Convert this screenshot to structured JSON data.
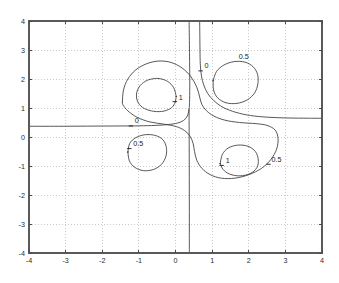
{
  "figure": {
    "title": "",
    "background_color": "#ffffff",
    "axes_color": "#5a5a5a",
    "grid_color": "#b4b4b4",
    "contour_color": "#3a3a3a"
  },
  "chart_data": {
    "type": "line",
    "subtype": "contour",
    "title": "",
    "xlabel": "",
    "ylabel": "",
    "xlim": [
      -4,
      4
    ],
    "ylim": [
      -4,
      4
    ],
    "grid": true,
    "grid_style": "dotted",
    "legend": "none",
    "x_ticks": [
      -4,
      -3,
      -2,
      -1,
      0,
      1,
      2,
      3,
      4
    ],
    "y_ticks": [
      -4,
      -3,
      -2,
      -1,
      0,
      1,
      2,
      3,
      4
    ],
    "x_tick_labels": [
      "-4",
      "-3",
      "-2",
      "-1",
      "0",
      "1",
      "2",
      "3",
      "4"
    ],
    "y_tick_labels": [
      "-4",
      "-3",
      "-2",
      "-1",
      "0",
      "1",
      "2",
      "3",
      "4"
    ],
    "contour_levels": [
      0,
      0.5,
      1
    ],
    "contour_label_values": [
      "0",
      "0.5",
      "1",
      "0",
      "0.5",
      "1",
      "0.5"
    ],
    "contours": [
      {
        "level": 0,
        "name": "zero-left-branch",
        "closed": false,
        "points": [
          [
            -4.0,
            0.37
          ],
          [
            -3.2,
            0.37
          ],
          [
            -2.4,
            0.375
          ],
          [
            -1.6,
            0.38
          ],
          [
            -1.0,
            0.385
          ],
          [
            -0.55,
            0.4
          ],
          [
            -0.2,
            0.43
          ],
          [
            0.05,
            0.48
          ],
          [
            0.22,
            0.57
          ],
          [
            0.32,
            0.72
          ],
          [
            0.37,
            0.95
          ],
          [
            0.385,
            1.3
          ],
          [
            0.39,
            1.9
          ],
          [
            0.385,
            2.6
          ],
          [
            0.38,
            3.2
          ],
          [
            0.375,
            3.7
          ],
          [
            0.372,
            4.0
          ]
        ]
      },
      {
        "level": 0,
        "name": "zero-right-branch",
        "closed": false,
        "points": [
          [
            0.66,
            4.0
          ],
          [
            0.665,
            3.4
          ],
          [
            0.67,
            2.85
          ],
          [
            0.68,
            2.45
          ],
          [
            0.71,
            2.1
          ],
          [
            0.77,
            1.8
          ],
          [
            0.88,
            1.5
          ],
          [
            1.05,
            1.25
          ],
          [
            1.3,
            1.02
          ],
          [
            1.65,
            0.85
          ],
          [
            2.05,
            0.74
          ],
          [
            2.55,
            0.68
          ],
          [
            3.1,
            0.655
          ],
          [
            3.6,
            0.648
          ],
          [
            4.0,
            0.645
          ]
        ]
      },
      {
        "level": 0,
        "name": "zero-descending-branch",
        "closed": false,
        "points": [
          [
            0.37,
            0.95
          ],
          [
            0.372,
            0.4
          ],
          [
            0.374,
            -0.3
          ],
          [
            0.376,
            -1.0
          ],
          [
            0.377,
            -1.8
          ],
          [
            0.378,
            -2.6
          ],
          [
            0.378,
            -3.3
          ],
          [
            0.378,
            -4.0
          ]
        ]
      },
      {
        "level": 0.5,
        "name": "upper-left-outer-lobe",
        "closed": false,
        "points": [
          [
            -1.45,
            1.2
          ],
          [
            -1.42,
            1.62
          ],
          [
            -1.3,
            2.0
          ],
          [
            -1.08,
            2.32
          ],
          [
            -0.78,
            2.53
          ],
          [
            -0.45,
            2.62
          ],
          [
            -0.12,
            2.57
          ],
          [
            0.18,
            2.38
          ],
          [
            0.42,
            2.08
          ],
          [
            0.58,
            1.72
          ],
          [
            0.66,
            1.38
          ],
          [
            0.72,
            1.12
          ],
          [
            0.85,
            0.9
          ],
          [
            1.05,
            0.72
          ],
          [
            1.35,
            0.58
          ],
          [
            1.75,
            0.5
          ],
          [
            2.2,
            0.46
          ],
          [
            2.5,
            0.4
          ],
          [
            2.72,
            0.24
          ],
          [
            2.8,
            -0.05
          ],
          [
            2.76,
            -0.42
          ],
          [
            2.6,
            -0.78
          ],
          [
            2.35,
            -1.08
          ],
          [
            2.0,
            -1.3
          ],
          [
            1.62,
            -1.42
          ],
          [
            1.25,
            -1.42
          ],
          [
            0.95,
            -1.3
          ],
          [
            0.72,
            -1.08
          ],
          [
            0.58,
            -0.8
          ],
          [
            0.52,
            -0.5
          ],
          [
            0.48,
            -0.22
          ],
          [
            0.4,
            0.02
          ],
          [
            0.25,
            0.22
          ],
          [
            0.02,
            0.36
          ],
          [
            -0.3,
            0.44
          ],
          [
            -0.7,
            0.52
          ],
          [
            -1.05,
            0.68
          ],
          [
            -1.3,
            0.9
          ],
          [
            -1.43,
            1.1
          ],
          [
            -1.45,
            1.2
          ]
        ]
      },
      {
        "level": 1,
        "name": "upper-left-inner-loop",
        "closed": true,
        "points": [
          [
            0.02,
            1.4
          ],
          [
            -0.05,
            1.7
          ],
          [
            -0.22,
            1.92
          ],
          [
            -0.48,
            2.02
          ],
          [
            -0.76,
            1.96
          ],
          [
            -0.96,
            1.78
          ],
          [
            -1.06,
            1.52
          ],
          [
            -1.04,
            1.24
          ],
          [
            -0.9,
            1.02
          ],
          [
            -0.66,
            0.9
          ],
          [
            -0.38,
            0.88
          ],
          [
            -0.14,
            0.98
          ],
          [
            -0.02,
            1.16
          ],
          [
            0.02,
            1.4
          ]
        ]
      },
      {
        "level": 0.5,
        "name": "upper-right-loop",
        "closed": true,
        "points": [
          [
            1.03,
            1.95
          ],
          [
            1.12,
            2.26
          ],
          [
            1.32,
            2.48
          ],
          [
            1.6,
            2.6
          ],
          [
            1.9,
            2.58
          ],
          [
            2.12,
            2.42
          ],
          [
            2.24,
            2.16
          ],
          [
            2.25,
            1.84
          ],
          [
            2.16,
            1.52
          ],
          [
            1.96,
            1.28
          ],
          [
            1.68,
            1.16
          ],
          [
            1.38,
            1.18
          ],
          [
            1.15,
            1.35
          ],
          [
            1.04,
            1.62
          ],
          [
            1.03,
            1.95
          ]
        ]
      },
      {
        "level": 0.5,
        "name": "lower-left-loop",
        "closed": true,
        "points": [
          [
            -1.3,
            -0.52
          ],
          [
            -1.25,
            -0.22
          ],
          [
            -1.08,
            -0.02
          ],
          [
            -0.82,
            0.08
          ],
          [
            -0.54,
            0.05
          ],
          [
            -0.34,
            -0.1
          ],
          [
            -0.25,
            -0.36
          ],
          [
            -0.26,
            -0.66
          ],
          [
            -0.38,
            -0.94
          ],
          [
            -0.6,
            -1.12
          ],
          [
            -0.88,
            -1.16
          ],
          [
            -1.12,
            -1.04
          ],
          [
            -1.26,
            -0.82
          ],
          [
            -1.3,
            -0.52
          ]
        ]
      },
      {
        "level": 1,
        "name": "lower-right-inner-loop",
        "closed": true,
        "points": [
          [
            1.22,
            -0.92
          ],
          [
            1.28,
            -0.6
          ],
          [
            1.44,
            -0.38
          ],
          [
            1.7,
            -0.28
          ],
          [
            1.98,
            -0.32
          ],
          [
            2.18,
            -0.5
          ],
          [
            2.26,
            -0.78
          ],
          [
            2.22,
            -1.06
          ],
          [
            2.04,
            -1.26
          ],
          [
            1.76,
            -1.34
          ],
          [
            1.48,
            -1.28
          ],
          [
            1.3,
            -1.12
          ],
          [
            1.22,
            -0.92
          ]
        ]
      }
    ],
    "inline_labels": [
      {
        "text": "0",
        "x": -1.22,
        "y": 0.38,
        "dx": 4,
        "dy": -3,
        "tick": true,
        "name": "contour-label-zero-left"
      },
      {
        "text": "0",
        "x": 0.685,
        "y": 2.28,
        "dx": 4,
        "dy": -3,
        "tick": true,
        "name": "contour-label-zero-top"
      },
      {
        "text": "0.5",
        "x": 1.78,
        "y": 2.59,
        "dx": -2,
        "dy": -3,
        "tick": false,
        "name": "contour-label-half-upper-right"
      },
      {
        "text": "1",
        "x": -0.02,
        "y": 1.22,
        "dx": 4,
        "dy": -2,
        "tick": true,
        "name": "contour-label-one-upper-left"
      },
      {
        "text": "0.5",
        "x": -1.26,
        "y": -0.4,
        "dx": 4,
        "dy": -3,
        "tick": true,
        "name": "contour-label-half-lower-left"
      },
      {
        "text": "1",
        "x": 1.26,
        "y": -0.98,
        "dx": 4,
        "dy": -2,
        "tick": true,
        "name": "contour-label-one-lower-right"
      },
      {
        "text": "0.5",
        "x": 2.54,
        "y": -0.94,
        "dx": 3,
        "dy": -2,
        "tick": true,
        "name": "contour-label-half-lower-right"
      }
    ]
  },
  "axes_box": {
    "left_px": 29,
    "top_px": 21,
    "right_px": 322,
    "bottom_px": 253
  }
}
